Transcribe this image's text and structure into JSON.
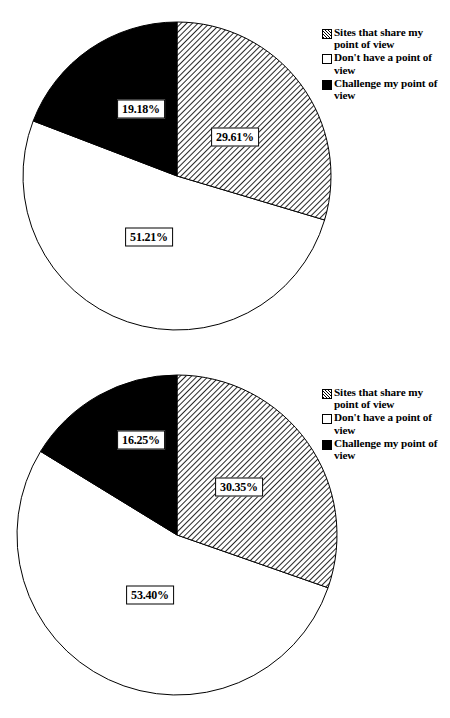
{
  "chart_data": [
    {
      "type": "pie",
      "title": "",
      "id": "pie-chart-1",
      "legend_position": "top-right",
      "categories": [
        "Sites that share my point of view",
        "Don't have a point of view",
        "Challenge my point of view"
      ],
      "values": [
        29.61,
        51.21,
        19.18
      ],
      "labels": [
        "29.61%",
        "51.21%",
        "19.18%"
      ],
      "colors": [
        "hatched-diagonal",
        "#ffffff",
        "#000000"
      ]
    },
    {
      "type": "pie",
      "title": "",
      "id": "pie-chart-2",
      "legend_position": "top-right",
      "categories": [
        "Sites that share my point of view",
        "Don't have a point of view",
        "Challenge my point of view"
      ],
      "values": [
        30.35,
        53.4,
        16.25
      ],
      "labels": [
        "30.35%",
        "53.40%",
        "16.25%"
      ],
      "colors": [
        "hatched-diagonal",
        "#ffffff",
        "#000000"
      ]
    }
  ],
  "charts": [
    {
      "legend": {
        "items": [
          {
            "label": "Sites that share my point of view",
            "swatch": "hatched-diagonal"
          },
          {
            "label": "Don't have a point of view",
            "swatch": "white"
          },
          {
            "label": "Challenge my point of view",
            "swatch": "black"
          }
        ]
      },
      "slice_labels": {
        "hatched": "29.61%",
        "white": "51.21%",
        "black": "19.18%"
      }
    },
    {
      "legend": {
        "items": [
          {
            "label": "Sites that share my point of view",
            "swatch": "hatched-diagonal"
          },
          {
            "label": "Don't have a point of view",
            "swatch": "white"
          },
          {
            "label": "Challenge my point of view",
            "swatch": "black"
          }
        ]
      },
      "slice_labels": {
        "hatched": "30.35%",
        "white": "53.40%",
        "black": "16.25%"
      }
    }
  ]
}
